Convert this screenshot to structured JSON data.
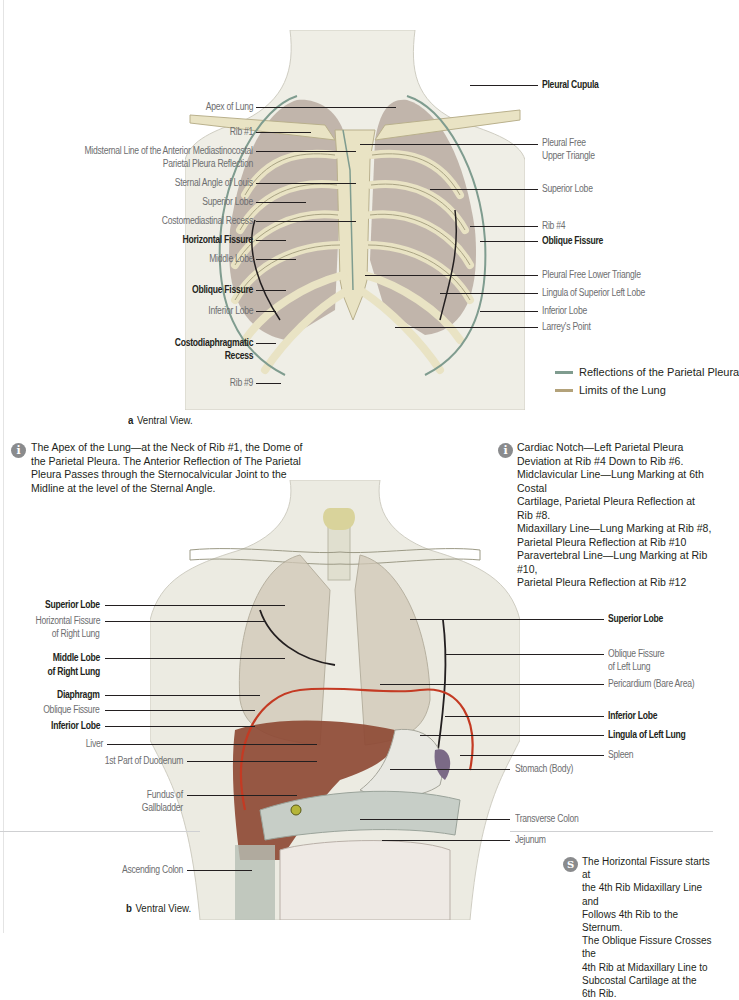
{
  "colors": {
    "parietal_pleura": "#7f9c8f",
    "lung_limit": "#b3a27a",
    "bone": "#e9e3c4",
    "lung": "#b9aaa0",
    "skin": "#efeee6",
    "liver": "#8e4a35",
    "diaphragm_line": "#c43a23",
    "icon_gray": "#8a8b8d"
  },
  "figure_a": {
    "caption_letter": "a",
    "caption_text": "Ventral View.",
    "labels_left": [
      {
        "text": "Apex of Lung",
        "bold": false
      },
      {
        "text": "Rib #1",
        "bold": false
      },
      {
        "text": "Midsternal Line of the Anterior Mediastinocostal",
        "bold": false
      },
      {
        "text": "Parietal Pleura Reflection",
        "bold": false
      },
      {
        "text": "Sternal Angle of Louis",
        "bold": false
      },
      {
        "text": "Superior Lobe",
        "bold": false
      },
      {
        "text": "Costomediastinal Recess",
        "bold": false
      },
      {
        "text": "Horizontal Fissure",
        "bold": true
      },
      {
        "text": "Middle Lobe",
        "bold": false
      },
      {
        "text": "Oblique Fissure",
        "bold": true
      },
      {
        "text": "Inferior Lobe",
        "bold": false
      },
      {
        "text": "Costodiaphragmatic",
        "bold": true
      },
      {
        "text": "Recess",
        "bold": true
      },
      {
        "text": "Rib #9",
        "bold": false
      }
    ],
    "labels_right": [
      {
        "text": "Pleural Cupula",
        "bold": true
      },
      {
        "text": "Pleural Free",
        "bold": false
      },
      {
        "text": "Upper Triangle",
        "bold": false
      },
      {
        "text": "Superior Lobe",
        "bold": false
      },
      {
        "text": "Rib #4",
        "bold": false
      },
      {
        "text": "Oblique Fissure",
        "bold": true
      },
      {
        "text": "Pleural Free Lower Triangle",
        "bold": false
      },
      {
        "text": "Lingula of Superior Left Lobe",
        "bold": false
      },
      {
        "text": "Inferior Lobe",
        "bold": false
      },
      {
        "text": "Larrey's Point",
        "bold": false
      }
    ],
    "legend": [
      {
        "label": "Reflections of the Parietal Pleura",
        "color": "#7f9c8f"
      },
      {
        "label": "Limits of the Lung",
        "color": "#b3a27a"
      }
    ]
  },
  "notes": {
    "apex_note": {
      "icon": "info-icon",
      "lines": [
        "The Apex of the Lung—at the Neck of Rib #1, the Dome of",
        "the Parietal Pleura. The Anterior Reflection of  The Parietal",
        "Pleura Passes through the Sternocalvicular Joint to the",
        "Midline at the level of the Sternal Angle."
      ]
    },
    "cardiac_note": {
      "icon": "info-icon",
      "lines": [
        "Cardiac Notch—Left Parietal Pleura",
        "Deviation at Rib #4 Down to Rib #6.",
        "Midclavicular Line—Lung Marking at 6th Costal",
        "Cartilage, Parietal Pleura Reflection at Rib #8.",
        "Midaxillary Line—Lung Marking at Rib #8,",
        "Parietal Pleura Reflection at Rib #10",
        "Paravertebral Line—Lung Marking at Rib #10,",
        "Parietal Pleura Reflection at Rib #12"
      ]
    },
    "fissure_note": {
      "icon": "clinical-tip-icon",
      "lines": [
        "The Horizontal Fissure starts at",
        "the 4th Rib Midaxillary Line and",
        "Follows 4th Rib to the Sternum.",
        "The Oblique Fissure Crosses the",
        "4th Rib at Midaxillary Line to",
        "Subcostal Cartilage at the 6th Rib."
      ]
    }
  },
  "figure_b": {
    "caption_letter": "b",
    "caption_text": "Ventral View.",
    "labels_left": [
      {
        "text": "Superior Lobe",
        "bold": true
      },
      {
        "text": "Horizontal Fissure",
        "bold": false
      },
      {
        "text": "of Right Lung",
        "bold": false
      },
      {
        "text": "Middle Lobe",
        "bold": true
      },
      {
        "text": "of Right Lung",
        "bold": true
      },
      {
        "text": "Diaphragm",
        "bold": true
      },
      {
        "text": "Oblique Fissure",
        "bold": false
      },
      {
        "text": "Inferior Lobe",
        "bold": true
      },
      {
        "text": "Liver",
        "bold": false
      },
      {
        "text": "1st Part of Duodenum",
        "bold": false
      },
      {
        "text": "Fundus of",
        "bold": false
      },
      {
        "text": "Gallbladder",
        "bold": false
      },
      {
        "text": "Ascending Colon",
        "bold": false
      }
    ],
    "labels_right": [
      {
        "text": "Superior Lobe",
        "bold": true
      },
      {
        "text": "Oblique Fissure",
        "bold": false
      },
      {
        "text": "of Left Lung",
        "bold": false
      },
      {
        "text": "Pericardium (Bare Area)",
        "bold": false
      },
      {
        "text": "Inferior Lobe",
        "bold": true
      },
      {
        "text": "Lingula of Left Lung",
        "bold": true
      },
      {
        "text": "Spleen",
        "bold": false
      },
      {
        "text": "Stomach (Body)",
        "bold": false
      },
      {
        "text": "Transverse Colon",
        "bold": false
      },
      {
        "text": "Jejunum",
        "bold": false
      }
    ]
  }
}
